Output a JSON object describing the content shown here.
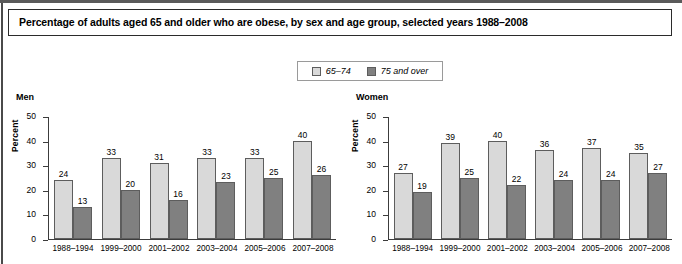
{
  "title": "Percentage of adults aged 65 and older who are obese, by sex and age group, selected years 1988–2008",
  "legend": {
    "items": [
      {
        "label": "65–74",
        "color": "#d9d9d9",
        "swatch": "light"
      },
      {
        "label": "75 and over",
        "color": "#808080",
        "swatch": "dark"
      }
    ]
  },
  "panels": [
    {
      "name": "Men",
      "ylabel": "Percent"
    },
    {
      "name": "Women",
      "ylabel": "Percent"
    }
  ],
  "yticks": [
    "50",
    "40",
    "30",
    "20",
    "10",
    "0"
  ],
  "chart_data": [
    {
      "type": "bar",
      "title": "Men",
      "xlabel": "",
      "ylabel": "Percent",
      "ylim": [
        0,
        50
      ],
      "yticks": [
        0,
        10,
        20,
        30,
        40,
        50
      ],
      "grid": false,
      "legend_position": "top-center",
      "categories": [
        "1988–1994",
        "1999–2000",
        "2001–2002",
        "2003–2004",
        "2005–2006",
        "2007–2008"
      ],
      "series": [
        {
          "name": "65–74",
          "color": "#d9d9d9",
          "values": [
            24,
            33,
            31,
            33,
            33,
            40
          ]
        },
        {
          "name": "75 and over",
          "color": "#808080",
          "values": [
            13,
            20,
            16,
            23,
            25,
            26
          ]
        }
      ]
    },
    {
      "type": "bar",
      "title": "Women",
      "xlabel": "",
      "ylabel": "Percent",
      "ylim": [
        0,
        50
      ],
      "yticks": [
        0,
        10,
        20,
        30,
        40,
        50
      ],
      "grid": false,
      "legend_position": "top-center",
      "categories": [
        "1988–1994",
        "1999–2000",
        "2001–2002",
        "2003–2004",
        "2005–2006",
        "2007–2008"
      ],
      "series": [
        {
          "name": "65–74",
          "color": "#d9d9d9",
          "values": [
            27,
            39,
            40,
            36,
            37,
            35
          ]
        },
        {
          "name": "75 and over",
          "color": "#808080",
          "values": [
            19,
            25,
            22,
            24,
            24,
            27
          ]
        }
      ]
    }
  ]
}
